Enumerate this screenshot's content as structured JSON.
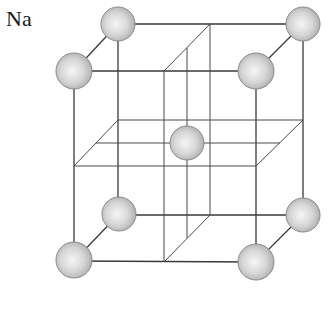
{
  "diagram": {
    "title": "Na",
    "structure": "body-centered cubic unit cell",
    "colors": {
      "line": "#3a3a3a",
      "sphere_light": "#f4f4f4",
      "sphere_mid": "#d2d2d2",
      "sphere_edge": "#8a8a8a"
    },
    "atoms": [
      {
        "id": "back-top-left",
        "x": 118,
        "y": 24,
        "r": 17
      },
      {
        "id": "back-top-right",
        "x": 303,
        "y": 24,
        "r": 17
      },
      {
        "id": "front-top-left",
        "x": 74,
        "y": 71,
        "r": 18
      },
      {
        "id": "front-top-right",
        "x": 256,
        "y": 71,
        "r": 18
      },
      {
        "id": "body-center",
        "x": 187,
        "y": 143,
        "r": 17
      },
      {
        "id": "back-bottom-left",
        "x": 119,
        "y": 214,
        "r": 17
      },
      {
        "id": "back-bottom-right",
        "x": 303,
        "y": 215,
        "r": 17
      },
      {
        "id": "front-bottom-left",
        "x": 74,
        "y": 260,
        "r": 18
      },
      {
        "id": "front-bottom-right",
        "x": 256,
        "y": 262,
        "r": 18
      }
    ]
  }
}
